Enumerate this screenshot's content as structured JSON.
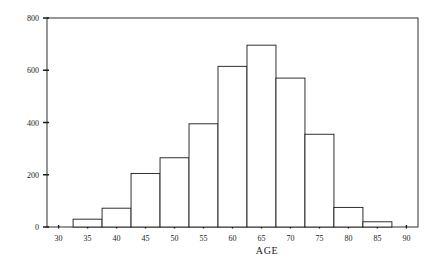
{
  "chart_data": {
    "type": "bar",
    "title": "",
    "subtitle": "",
    "xlabel": "AGE",
    "ylabel": "",
    "xlim": [
      28,
      92
    ],
    "ylim": [
      0,
      800
    ],
    "grid": false,
    "legend": "none",
    "bin_width": 5,
    "bin_edges": [
      32.5,
      37.5,
      42.5,
      47.5,
      52.5,
      57.5,
      62.5,
      67.5,
      72.5,
      77.5,
      82.5,
      87.5
    ],
    "categories": [
      "32.5-37.5",
      "37.5-42.5",
      "42.5-47.5",
      "47.5-52.5",
      "52.5-57.5",
      "57.5-62.5",
      "62.5-67.5",
      "67.5-72.5",
      "72.5-77.5",
      "77.5-82.5",
      "82.5-87.5"
    ],
    "values": [
      30,
      72,
      205,
      265,
      395,
      615,
      696,
      570,
      355,
      75,
      20
    ],
    "xticks": [
      30,
      35,
      40,
      45,
      50,
      55,
      60,
      65,
      70,
      75,
      80,
      85,
      90
    ],
    "xtick_labels": [
      "30",
      "35",
      "40",
      "45",
      "50",
      "55",
      "60",
      "65",
      "70",
      "75",
      "80",
      "85",
      "90"
    ],
    "yticks": [
      0,
      200,
      400,
      600,
      800
    ],
    "ytick_labels": [
      "0",
      "200",
      "400",
      "600",
      "800"
    ],
    "bar_fill": "#ffffff",
    "bar_stroke": "#1a1a1a",
    "axis_color": "#1a1a1a",
    "background": "#ffffff"
  }
}
